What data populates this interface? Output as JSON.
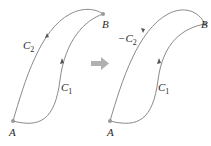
{
  "figure": {
    "left_panel": {
      "point_start": "A",
      "point_end": "B",
      "curve_upper": {
        "name": "C",
        "sub": "2"
      },
      "curve_lower": {
        "name": "C",
        "sub": "1"
      }
    },
    "transition_arrow": "right-arrow-icon",
    "right_panel": {
      "point_start": "A",
      "point_end": "B",
      "curve_upper": {
        "name": "−C",
        "sub": "2"
      },
      "curve_lower": {
        "name": "C",
        "sub": "1"
      }
    },
    "colors": {
      "curve": "#8a8a8a",
      "arrow": "#b0b0b0",
      "text": "#2a2a2a"
    }
  }
}
